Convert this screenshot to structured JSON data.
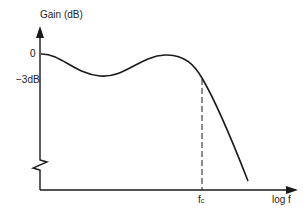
{
  "diagram": {
    "y_axis": {
      "label": "Gain (dB)",
      "ticks": [
        "0",
        "−3dB"
      ]
    },
    "x_axis": {
      "label": "log f",
      "marker": {
        "base": "f",
        "subscript": "c"
      }
    },
    "curve": {
      "description": "Rippled passband gain falling past cutoff"
    },
    "colors": {
      "line": "#1a1a1a",
      "text": "#222222",
      "background": "#ffffff"
    }
  }
}
